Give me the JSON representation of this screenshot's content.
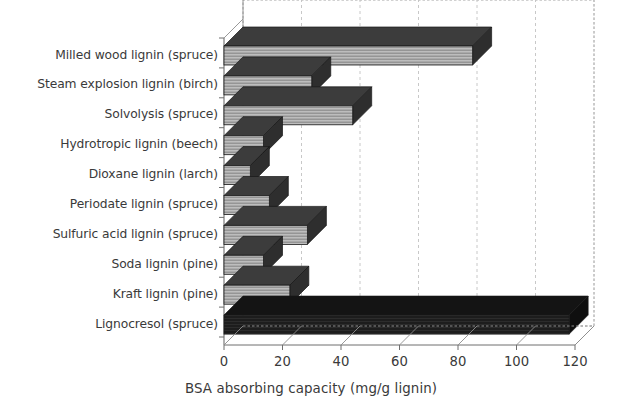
{
  "chart_data": {
    "type": "bar",
    "orientation": "horizontal",
    "style": "3d-bar",
    "title": "",
    "subtitle": "",
    "xlabel": "BSA absorbing capacity (mg/g lignin)",
    "ylabel": "",
    "xlim": [
      0,
      120
    ],
    "xticks": [
      0,
      20,
      40,
      60,
      80,
      100,
      120
    ],
    "xtick_labels": [
      "0",
      "20",
      "40",
      "60",
      "80",
      "100",
      "120"
    ],
    "grid": "vertical-dashed",
    "legend": "none",
    "categories": [
      "Milled wood lignin (spruce)",
      "Steam explosion lignin (birch)",
      "Solvolysis (spruce)",
      "Hydrotropic lignin (beech)",
      "Dioxane lignin (larch)",
      "Periodate lignin (spruce)",
      "Sulfuric acid lignin (spruce)",
      "Soda lignin (pine)",
      "Kraft lignin (pine)",
      "Lignocresol (spruce)"
    ],
    "values": [
      85,
      30,
      44,
      13.5,
      9,
      15.5,
      28.5,
      13.5,
      22.5,
      118
    ],
    "series": [
      {
        "name": "BSA absorbing capacity",
        "values": [
          85,
          30,
          44,
          13.5,
          9,
          15.5,
          28.5,
          13.5,
          22.5,
          118
        ]
      }
    ],
    "bar_colors": [
      "#a8a8a8",
      "#a8a8a8",
      "#a8a8a8",
      "#a8a8a8",
      "#a8a8a8",
      "#a8a8a8",
      "#a8a8a8",
      "#a8a8a8",
      "#a8a8a8",
      "#1e1e1e"
    ],
    "bar_top_colors": [
      "#3c3c3c",
      "#3c3c3c",
      "#3c3c3c",
      "#3c3c3c",
      "#3c3c3c",
      "#3c3c3c",
      "#3c3c3c",
      "#3c3c3c",
      "#3c3c3c",
      "#141414"
    ],
    "colors": {
      "axis": "#6e6e6e",
      "grid": "#b9b9b9",
      "text": "#3a3a3a",
      "background": "#ffffff",
      "bar_gray": "#a8a8a8",
      "bar_dark": "#1e1e1e"
    }
  }
}
